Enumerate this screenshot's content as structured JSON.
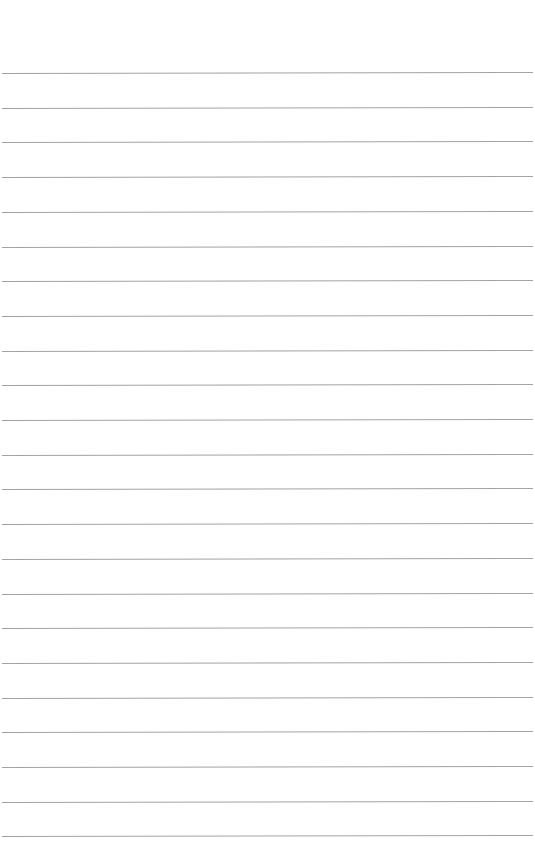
{
  "page": {
    "type": "lined-paper",
    "background_color": "#ffffff",
    "line_color": "#a3a3a3",
    "line_count": 23,
    "first_line_y": 73,
    "line_spacing": 34.7,
    "text_lines": []
  }
}
